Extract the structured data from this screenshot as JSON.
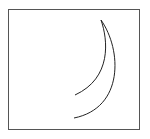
{
  "figure": {
    "frame": {
      "x": 8.5,
      "y": 9.5,
      "width": 131,
      "height": 120,
      "stroke": "#555555",
      "stroke_width": 1
    },
    "shape": {
      "name": "crescent",
      "stroke": "#222222",
      "stroke_width": 1,
      "inner_curve": "M101,20 C108,40 112,78 75,95",
      "outer_curve": "M101,20 C122,50 124,108 74,118"
    }
  }
}
